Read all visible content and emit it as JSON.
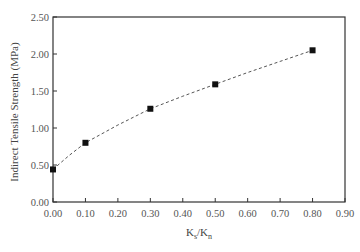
{
  "chart_data": {
    "type": "scatter",
    "title": "",
    "xlabel": "Ks/Kn",
    "xlabel_main": "K",
    "xlabel_sub1": "s",
    "xlabel_slash": "/K",
    "xlabel_sub2": "n",
    "ylabel": "Indirect Tensile Strength (MPa)",
    "xlim": [
      0.0,
      0.9
    ],
    "ylim": [
      0.0,
      2.5
    ],
    "x_ticks": [
      "0.00",
      "0.10",
      "0.20",
      "0.30",
      "0.40",
      "0.50",
      "0.60",
      "0.70",
      "0.80",
      "0.90"
    ],
    "y_ticks": [
      "0.00",
      "0.50",
      "1.00",
      "1.50",
      "2.00",
      "2.50"
    ],
    "grid": false,
    "legend": null,
    "series": [
      {
        "name": "Measured",
        "marker": "square",
        "x": [
          0.0,
          0.1,
          0.3,
          0.5,
          0.8
        ],
        "y": [
          0.44,
          0.8,
          1.26,
          1.59,
          2.05
        ]
      },
      {
        "name": "Trend",
        "style": "dashed",
        "x": [
          0.0,
          0.05,
          0.1,
          0.2,
          0.3,
          0.4,
          0.5,
          0.6,
          0.7,
          0.8
        ],
        "y": [
          0.44,
          0.63,
          0.8,
          1.04,
          1.26,
          1.43,
          1.59,
          1.75,
          1.9,
          2.05
        ]
      }
    ]
  }
}
